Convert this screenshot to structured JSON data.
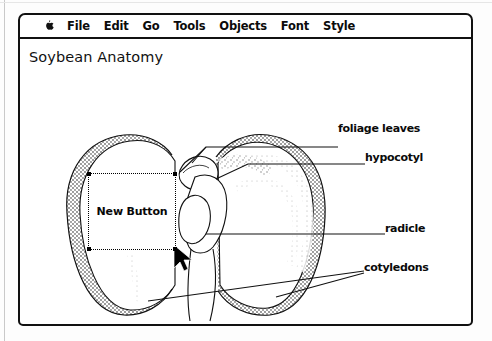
{
  "window": {
    "menu": {
      "apple_icon": "apple-icon",
      "items": [
        "File",
        "Edit",
        "Go",
        "Tools",
        "Objects",
        "Font",
        "Style"
      ]
    },
    "document": {
      "title": "Soybean Anatomy"
    }
  },
  "diagram": {
    "annotations": [
      {
        "id": "foliage-leaves",
        "label": "foliage leaves"
      },
      {
        "id": "hypocotyl",
        "label": "hypocotyl"
      },
      {
        "id": "radicle",
        "label": "radicle"
      },
      {
        "id": "cotyledons",
        "label": "cotyledons"
      }
    ]
  },
  "selected_object": {
    "type": "button",
    "label": "New Button",
    "selection_state": "selected"
  },
  "pointer": {
    "icon": "arrow-cursor-icon",
    "x": 158,
    "y": 224
  },
  "colors": {
    "ink": "#111111",
    "paper": "#ffffff",
    "shade": "#9a9a9a"
  }
}
